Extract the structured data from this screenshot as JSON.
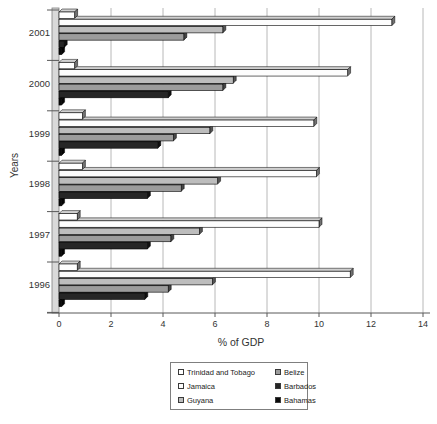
{
  "chart_data": {
    "type": "bar",
    "orientation": "horizontal",
    "title": "",
    "xlabel": "% of GDP",
    "ylabel": "Years",
    "xlim": [
      0,
      14
    ],
    "x_ticks": [
      0,
      2,
      4,
      6,
      8,
      10,
      12,
      14
    ],
    "grid": "vertical-gridlines",
    "categories": [
      "1996",
      "1997",
      "1998",
      "1999",
      "2000",
      "2001"
    ],
    "category_display_order": "bottom-to-top",
    "series": [
      {
        "name": "Trinidad and Tobago",
        "color": "#ffffff",
        "values": [
          0.7,
          0.7,
          0.9,
          0.9,
          0.6,
          0.6
        ]
      },
      {
        "name": "Jamaica",
        "color": "#fdfdfd",
        "values": [
          11.2,
          10.0,
          9.9,
          9.8,
          11.1,
          12.8
        ]
      },
      {
        "name": "Guyana",
        "color": "#bdbdbd",
        "values": [
          5.9,
          5.4,
          6.1,
          5.8,
          6.7,
          6.3
        ]
      },
      {
        "name": "Belize",
        "color": "#9c9c9c",
        "values": [
          4.2,
          4.3,
          4.7,
          4.4,
          6.3,
          4.8
        ]
      },
      {
        "name": "Barbados",
        "color": "#262626",
        "values": [
          3.3,
          3.4,
          3.4,
          3.8,
          4.2,
          0.2
        ]
      },
      {
        "name": "Bahamas",
        "color": "#0a0a0a",
        "values": [
          0.1,
          0.1,
          0.1,
          0.1,
          0.1,
          0.1
        ]
      }
    ],
    "legend": {
      "position": "bottom",
      "rows": [
        [
          "Trinidad and Tobago",
          "Belize"
        ],
        [
          "Jamaica",
          "Barbados"
        ],
        [
          "Guyana",
          "Bahamas"
        ]
      ]
    }
  },
  "colors": {
    "background": "#ffffff",
    "gridline": "#b8b8b8",
    "axis": "#595959",
    "text": "#333333",
    "wall": "#d9d9d9"
  }
}
